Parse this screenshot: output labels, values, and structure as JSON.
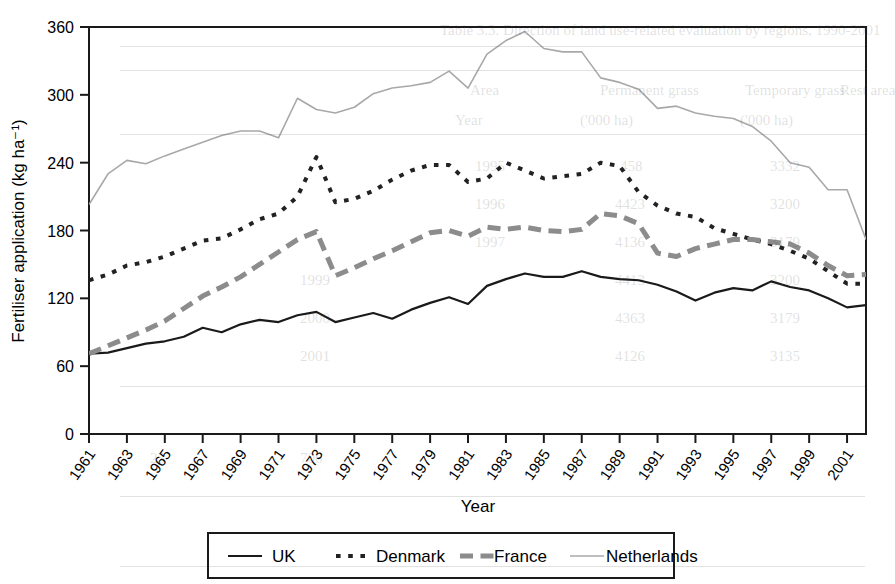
{
  "figure": {
    "background_color": "#ffffff",
    "plot_border_color": "#1a1a1a"
  },
  "chart_data": {
    "type": "line",
    "title": "",
    "xlabel": "Year",
    "ylabel": "Fertiliser application (kg ha⁻¹)",
    "xlim": [
      1961,
      2002
    ],
    "ylim": [
      0,
      360
    ],
    "yticks": [
      0,
      60,
      120,
      180,
      240,
      300,
      360
    ],
    "xticks": [
      1961,
      1963,
      1965,
      1967,
      1969,
      1971,
      1973,
      1975,
      1977,
      1979,
      1981,
      1983,
      1985,
      1987,
      1989,
      1991,
      1993,
      1995,
      1997,
      1999,
      2001
    ],
    "xtick_labels": [
      "1961",
      "1963",
      "1965",
      "1967",
      "1969",
      "1971",
      "1973",
      "1975",
      "1977",
      "1979",
      "1981",
      "1983",
      "1985",
      "1987",
      "1989",
      "1991",
      "1993",
      "1995",
      "1997",
      "1999",
      "2001"
    ],
    "grid": false,
    "legend_position": "below-axes",
    "x": [
      1961,
      1962,
      1963,
      1964,
      1965,
      1966,
      1967,
      1968,
      1969,
      1970,
      1971,
      1972,
      1973,
      1974,
      1975,
      1976,
      1977,
      1978,
      1979,
      1980,
      1981,
      1982,
      1983,
      1984,
      1985,
      1986,
      1987,
      1988,
      1989,
      1990,
      1991,
      1992,
      1993,
      1994,
      1995,
      1996,
      1997,
      1998,
      1999,
      2000,
      2001,
      2002
    ],
    "series": [
      {
        "name": "UK",
        "color": "#1a1a1a",
        "style": "solid",
        "width": 2.2,
        "values": [
          71,
          72,
          76,
          80,
          82,
          86,
          94,
          90,
          97,
          101,
          99,
          105,
          108,
          99,
          103,
          107,
          102,
          110,
          116,
          121,
          115,
          131,
          137,
          142,
          139,
          139,
          144,
          139,
          137,
          136,
          132,
          126,
          118,
          125,
          129,
          127,
          135,
          130,
          127,
          120,
          112,
          114
        ]
      },
      {
        "name": "Denmark",
        "color": "#222222",
        "style": "dotted",
        "width": 4.0,
        "values": [
          136,
          141,
          149,
          152,
          157,
          164,
          171,
          173,
          181,
          190,
          195,
          210,
          245,
          205,
          208,
          215,
          225,
          233,
          238,
          238,
          223,
          226,
          240,
          233,
          226,
          228,
          230,
          240,
          237,
          214,
          202,
          195,
          192,
          182,
          177,
          172,
          168,
          162,
          155,
          144,
          133,
          133
        ]
      },
      {
        "name": "France",
        "color": "#8c8c8c",
        "style": "dashed",
        "width": 5.0,
        "values": [
          71,
          78,
          85,
          92,
          100,
          111,
          122,
          130,
          139,
          150,
          161,
          172,
          179,
          140,
          147,
          155,
          162,
          170,
          178,
          180,
          175,
          183,
          181,
          183,
          180,
          179,
          181,
          195,
          193,
          186,
          160,
          157,
          164,
          168,
          172,
          172,
          170,
          168,
          160,
          149,
          140,
          141
        ]
      },
      {
        "name": "Netherlands",
        "color": "#a8a8a8",
        "style": "solid",
        "width": 1.6,
        "values": [
          203,
          230,
          242,
          239,
          246,
          252,
          258,
          264,
          268,
          268,
          262,
          297,
          287,
          284,
          289,
          301,
          306,
          308,
          311,
          321,
          306,
          336,
          348,
          356,
          341,
          338,
          338,
          315,
          311,
          305,
          288,
          290,
          284,
          281,
          279,
          272,
          259,
          240,
          236,
          216,
          216,
          172
        ]
      }
    ]
  },
  "legend": {
    "entries": [
      {
        "label": "UK",
        "sample": "solid-dark"
      },
      {
        "label": "Denmark",
        "sample": "dotted-dark"
      },
      {
        "label": "France",
        "sample": "dashed-gray"
      },
      {
        "label": "Netherlands",
        "sample": "solid-lightgray"
      }
    ]
  },
  "background_page_text": {
    "table_caption": "Table 3.3. Direction of land use-related evaluation by regions, 1990-2001",
    "column_headers": [
      "Area",
      "Permanent grass",
      "Temporary grass",
      "Rest area"
    ],
    "unit_row": [
      "Year",
      "('000 ha)",
      "('000 ha)",
      "('000 ha)"
    ],
    "rows": [
      [
        "1995",
        "458",
        "3332",
        "1224"
      ],
      [
        "1996",
        "4423",
        "3200",
        "1129"
      ],
      [
        "1997",
        "4136",
        "3179",
        "1116"
      ],
      [
        "1999",
        "4413",
        "3200",
        "1129"
      ],
      [
        "2000",
        "4363",
        "3179",
        "1116"
      ],
      [
        "2001",
        "4126",
        "3135",
        "1004"
      ]
    ]
  }
}
